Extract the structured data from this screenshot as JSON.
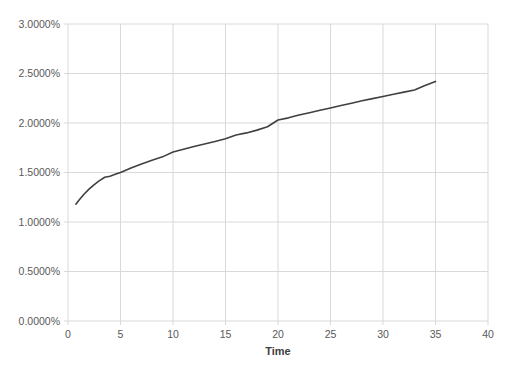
{
  "chart_data": {
    "type": "line",
    "title": "",
    "xlabel": "Time",
    "ylabel": "",
    "xlim": [
      0,
      40
    ],
    "ylim": [
      0,
      0.03
    ],
    "grid": true,
    "legend": false,
    "legend_position": "none",
    "line_color": "#404040",
    "grid_color": "#d9d9d9",
    "axis_color": "#d9d9d9",
    "tick_label_color": "#595959",
    "plot_background": "#ffffff",
    "y_tick_values": [
      0,
      0.005,
      0.01,
      0.015,
      0.02,
      0.025,
      0.03
    ],
    "y_tick_labels": [
      "0.0000%",
      "0.5000%",
      "1.0000%",
      "1.5000%",
      "2.0000%",
      "2.5000%",
      "3.0000%"
    ],
    "x_tick_values": [
      0,
      5,
      10,
      15,
      20,
      25,
      30,
      35,
      40
    ],
    "x_tick_labels": [
      "0",
      "5",
      "10",
      "15",
      "20",
      "25",
      "30",
      "35",
      "40"
    ],
    "series": [
      {
        "name": "yield curve",
        "color": "#404040",
        "x": [
          0.75,
          1,
          1.5,
          2,
          2.5,
          3,
          3.5,
          4,
          4.5,
          5,
          6,
          7,
          8,
          9,
          10,
          11,
          12,
          13,
          14,
          15,
          16,
          17,
          18,
          19,
          20,
          21,
          22,
          23,
          24,
          25,
          26,
          27,
          28,
          29,
          30,
          31,
          32,
          33,
          34,
          35
        ],
        "y": [
          1.18,
          1.215,
          1.278,
          1.332,
          1.378,
          1.418,
          1.452,
          1.463,
          1.482,
          1.5,
          1.546,
          1.587,
          1.624,
          1.658,
          1.707,
          1.734,
          1.762,
          1.788,
          1.813,
          1.84,
          1.878,
          1.9,
          1.928,
          1.962,
          2.03,
          2.052,
          2.08,
          2.104,
          2.128,
          2.152,
          2.176,
          2.2,
          2.224,
          2.246,
          2.268,
          2.29,
          2.312,
          2.333,
          2.378,
          2.42
        ],
        "y_unit": "percent"
      }
    ]
  }
}
